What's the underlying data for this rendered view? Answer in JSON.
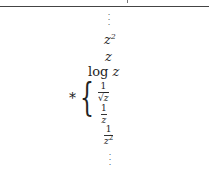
{
  "stack": {
    "top_ellipsis": "⋮",
    "z_squared_base": "z",
    "z_squared_exp": "2",
    "z": "z",
    "log_fn": "log",
    "log_arg": "z",
    "asterisk": "*",
    "brace": "{",
    "frac_inv_sqrt": {
      "num": "1",
      "sqrt_symbol": "√",
      "den": "z"
    },
    "frac_inv": {
      "num": "1",
      "den": "z"
    },
    "frac_inv_sq": {
      "num": "1",
      "den_base": "z",
      "den_exp": "2"
    },
    "bottom_ellipsis": "⋮"
  }
}
